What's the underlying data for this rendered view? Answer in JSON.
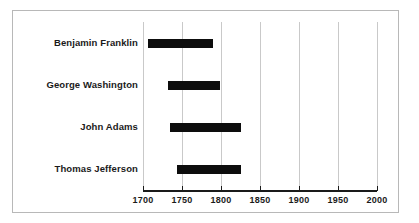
{
  "chart_data": {
    "type": "bar",
    "orientation": "horizontal",
    "subtype": "range-bar",
    "title": "",
    "xlabel": "",
    "ylabel": "",
    "categories": [
      "Benjamin Franklin",
      "George Washington",
      "John Adams",
      "Thomas Jefferson"
    ],
    "ranges": [
      {
        "category": "Benjamin Franklin",
        "start": 1706,
        "end": 1790
      },
      {
        "category": "George Washington",
        "start": 1732,
        "end": 1799
      },
      {
        "category": "John Adams",
        "start": 1735,
        "end": 1826
      },
      {
        "category": "Thomas Jefferson",
        "start": 1743,
        "end": 1826
      }
    ],
    "values": [
      84,
      67,
      91,
      83
    ],
    "xlim": [
      1700,
      2000
    ],
    "xticks": [
      1700,
      1750,
      1800,
      1850,
      1900,
      1950,
      2000
    ],
    "xtick_labels": [
      "1700",
      "1750",
      "1800",
      "1850",
      "1900",
      "1950",
      "2000"
    ],
    "grid": "vertical",
    "legend": "none",
    "bar_color": "#0d0d0d",
    "gridline_color": "#c9c9c9",
    "axis_color": "#1a1a1a",
    "background_color": "#ffffff",
    "border_color": "#b8b8b8"
  }
}
